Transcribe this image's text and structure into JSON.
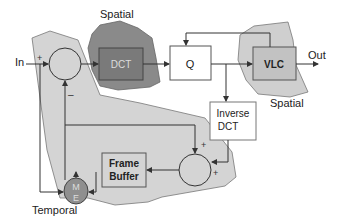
{
  "diagram": {
    "colors": {
      "temporal_region": "#d4d4d4",
      "spatial_dct_region": "#8a8a8a",
      "spatial_vlc_region": "#cfcfcf",
      "dct_block_fill": "#7a7a7a",
      "vlc_block_fill": "#c2c2c2",
      "me_fill": "#8f8f8f",
      "line": "#333333",
      "box_border": "#555555"
    },
    "labels": {
      "input": "In",
      "output": "Out",
      "spatial_top": "Spatial",
      "spatial_right": "Spatial",
      "temporal": "Temporal"
    },
    "blocks": {
      "dct": "DCT",
      "quantizer": "Q",
      "vlc": "VLC",
      "inverse_dct_line1": "Inverse",
      "inverse_dct_line2": "DCT",
      "frame_buffer_line1": "Frame",
      "frame_buffer_line2": "Buffer",
      "motion_estimation_top": "M",
      "motion_estimation_bottom": "E"
    },
    "signs": {
      "sub_plus": "+",
      "sub_minus": "–",
      "add_plus_top": "+",
      "add_plus_right": "+"
    }
  }
}
